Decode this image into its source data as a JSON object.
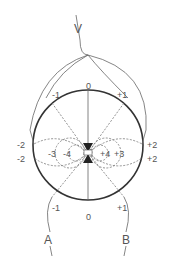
{
  "diagram": {
    "type": "electrode potential field diagram",
    "terminals": {
      "top": "V",
      "bottom_left": "A",
      "bottom_right": "B"
    },
    "circle_labels_outer": {
      "top": "0",
      "top_left": "-1",
      "top_right": "+1",
      "left_upper": "-2",
      "right_upper": "+2",
      "left_lower": "-2",
      "right_lower": "+2",
      "bottom_left": "-1",
      "bottom_right": "+1",
      "bottom": "0"
    },
    "inner_labels": {
      "left_3": "-3",
      "left_4": "-4",
      "right_4": "+4",
      "right_3": "+3",
      "center": "– ⊕"
    },
    "colors": {
      "line": "#555555",
      "circle": "#333333",
      "dashed": "#777777"
    }
  }
}
